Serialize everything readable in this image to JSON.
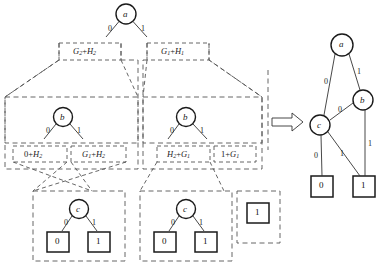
{
  "figure": {
    "title": "",
    "transform_arrow": "double-right-arrow"
  },
  "left_diagram": {
    "name": "expanded-decision-tree",
    "root": {
      "label": "a",
      "type": "decision-node"
    },
    "root_edges": [
      {
        "label": "0",
        "side": "left"
      },
      {
        "label": "1",
        "side": "right"
      }
    ],
    "top_expressions": [
      {
        "text": "G2+H2",
        "base1": "G",
        "sub1": "2",
        "op": "+",
        "base2": "H",
        "sub2": "2"
      },
      {
        "text": "G1+H1",
        "base1": "G",
        "sub1": "1",
        "op": "+",
        "base2": "H",
        "sub2": "1"
      }
    ],
    "subtrees": [
      {
        "name": "left-b-subtree",
        "node": {
          "label": "b",
          "type": "decision-node"
        },
        "edges": [
          {
            "label": "0"
          },
          {
            "label": "1"
          }
        ],
        "expressions": [
          {
            "text": "0+H2",
            "base1": "0",
            "sub1": "",
            "op": "+",
            "base2": "H",
            "sub2": "2"
          },
          {
            "text": "G1+H2",
            "base1": "G",
            "sub1": "1",
            "op": "+",
            "base2": "H",
            "sub2": "2"
          }
        ]
      },
      {
        "name": "right-b-subtree",
        "node": {
          "label": "b",
          "type": "decision-node"
        },
        "edges": [
          {
            "label": "0"
          },
          {
            "label": "1"
          }
        ],
        "expressions": [
          {
            "text": "H2+G1",
            "base1": "H",
            "sub1": "2",
            "op": "+",
            "base2": "G",
            "sub2": "1"
          },
          {
            "text": "1+G1",
            "base1": "1",
            "sub1": "",
            "op": "+",
            "base2": "G",
            "sub2": "1"
          }
        ]
      }
    ],
    "c_subtrees": [
      {
        "name": "left-c-subtree",
        "node": {
          "label": "c",
          "type": "decision-node"
        },
        "edges": [
          {
            "label": "0"
          },
          {
            "label": "1"
          }
        ],
        "terminals": [
          {
            "label": "0"
          },
          {
            "label": "1"
          }
        ]
      },
      {
        "name": "right-c-subtree",
        "node": {
          "label": "c",
          "type": "decision-node"
        },
        "edges": [
          {
            "label": "0"
          },
          {
            "label": "1"
          }
        ],
        "terminals": [
          {
            "label": "0"
          },
          {
            "label": "1"
          }
        ]
      }
    ],
    "standalone_terminal": {
      "label": "1"
    }
  },
  "right_diagram": {
    "name": "reduced-bdd",
    "nodes": [
      {
        "id": "a",
        "label": "a",
        "type": "decision-node"
      },
      {
        "id": "b",
        "label": "b",
        "type": "decision-node"
      },
      {
        "id": "c",
        "label": "c",
        "type": "decision-node"
      }
    ],
    "terminals": [
      {
        "id": "t0",
        "label": "0"
      },
      {
        "id": "t1",
        "label": "1"
      }
    ],
    "edges": [
      {
        "from": "a",
        "to": "c",
        "label": "0"
      },
      {
        "from": "a",
        "to": "b",
        "label": "1"
      },
      {
        "from": "b",
        "to": "c",
        "label": "0"
      },
      {
        "from": "b",
        "to": "t1",
        "label": "1"
      },
      {
        "from": "c",
        "to": "t0",
        "label": "0"
      },
      {
        "from": "c",
        "to": "t1",
        "label": "1"
      }
    ]
  },
  "style": {
    "line_color": "#333333",
    "dash_color": "#555555",
    "node_fill": "#ffffff",
    "terminal_fill": "#ffffff",
    "text_color": "#111111"
  }
}
